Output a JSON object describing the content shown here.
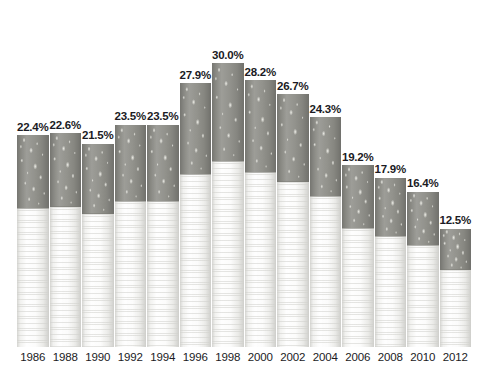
{
  "chart_data": {
    "type": "bar",
    "title": "",
    "subtitle": "",
    "xlabel": "",
    "ylabel": "",
    "categories": [
      "1986",
      "1988",
      "1990",
      "1992",
      "1994",
      "1996",
      "1998",
      "2000",
      "2002",
      "2004",
      "2006",
      "2008",
      "2010",
      "2012"
    ],
    "values": [
      22.4,
      22.6,
      21.5,
      23.5,
      23.5,
      27.9,
      30.0,
      28.2,
      26.7,
      24.3,
      19.2,
      17.9,
      16.4,
      12.5
    ],
    "value_labels": [
      "22.4%",
      "22.6%",
      "21.5%",
      "23.5%",
      "23.5%",
      "27.9%",
      "30.0%",
      "28.2%",
      "26.7%",
      "24.3%",
      "19.2%",
      "17.9%",
      "16.4%",
      "12.5%"
    ],
    "tick_labels": [
      "1986",
      "1988",
      "1990",
      "1992",
      "1994",
      "1996",
      "1998",
      "2000",
      "2002",
      "2004",
      "2006",
      "2008",
      "2010",
      "2012"
    ],
    "ylim": [
      0,
      33.5
    ],
    "grid": false,
    "legend": "none",
    "bar_style": "cigarette",
    "colors": {
      "tobacco": "#8d8d87",
      "filter": "#f4f4f2",
      "label_text": "#1b1b24",
      "tick_text": "#1b1b24",
      "background": "#ffffff"
    }
  }
}
